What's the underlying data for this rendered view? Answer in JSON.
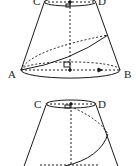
{
  "diagram": {
    "type": "geometry-frustum",
    "figures": [
      {
        "id": "frustum-top",
        "labels": {
          "top_left": "C",
          "top_right": "D",
          "bottom_left": "A",
          "bottom_right": "B"
        }
      },
      {
        "id": "frustum-bottom",
        "labels": {
          "top_left": "C",
          "top_right": "D"
        }
      }
    ],
    "colors": {
      "stroke": "#1a1a1a",
      "background": "#ffffff"
    }
  }
}
